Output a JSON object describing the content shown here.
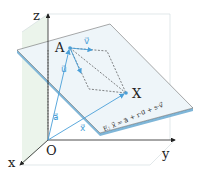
{
  "diagram": {
    "axes": {
      "x": "x",
      "y": "y",
      "z": "z",
      "origin": "O"
    },
    "points": {
      "a": "A",
      "x": "X"
    },
    "vectors": {
      "u": "u⃗",
      "v": "v⃗",
      "a": "a⃗",
      "x": "x⃗"
    },
    "equation": "E: x⃗ = a⃗ + r·u⃗ + s·v⃗",
    "colors": {
      "vector": "#4a9fd8",
      "plane_top": "#eaf3f8",
      "plane_edge": "#7fb6d8",
      "side_plane": "#e6f1e6",
      "axis": "#222222"
    }
  }
}
